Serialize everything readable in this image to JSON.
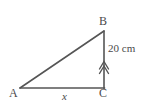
{
  "figure": {
    "type": "geometry-diagram",
    "shape": "right-triangle",
    "background_color": "#ffffff",
    "stroke_color": "#555555",
    "text_color": "#4a4a4a",
    "width": 141,
    "height": 111,
    "vertices": [
      {
        "name": "A",
        "label": "A",
        "x": 20,
        "y": 88
      },
      {
        "name": "B",
        "label": "B",
        "x": 104,
        "y": 31
      },
      {
        "name": "C",
        "label": "C",
        "x": 104,
        "y": 88
      }
    ],
    "sides": [
      {
        "name": "base-AC",
        "from": "A",
        "to": "C",
        "label": "x",
        "label_style": "italic"
      },
      {
        "name": "vertical-BC",
        "from": "C",
        "to": "B",
        "label": "20 cm",
        "label_style": "normal"
      },
      {
        "name": "hypotenuse-AB",
        "from": "A",
        "to": "B",
        "label": ""
      }
    ],
    "markers": [
      {
        "name": "double-chevron-arrow",
        "on_side": "vertical-BC",
        "direction": "up",
        "x": 104,
        "y": 66
      }
    ],
    "labels": {
      "vertex_a": "A",
      "vertex_b": "B",
      "vertex_c": "C",
      "base_length": "x",
      "height_measure": "20 cm"
    }
  }
}
